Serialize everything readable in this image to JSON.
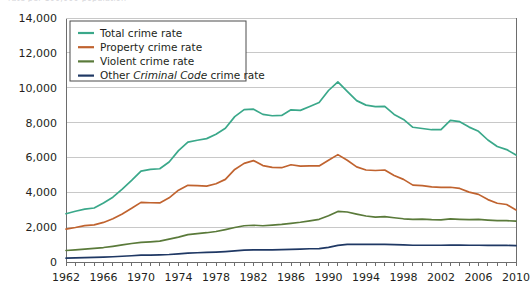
{
  "figure": {
    "clipped_top_text": "rate per 100,000 population",
    "background_color": "#ffffff"
  },
  "legend": {
    "position": "top-left-inside",
    "entries": [
      {
        "label": "Total crime rate",
        "color": "#3aa88a"
      },
      {
        "label": "Property crime rate",
        "color": "#c0632f"
      },
      {
        "label": "Violent crime rate",
        "color": "#5a7a3a"
      },
      {
        "label_prefix": "Other ",
        "label_emphasis": "Criminal Code",
        "label_suffix": " crime rate",
        "color": "#1f3864"
      }
    ]
  },
  "axes": {
    "y_tick_labels": [
      "14,000",
      "12,000",
      "10,000",
      "8,000",
      "6,000",
      "4,000",
      "2,000",
      "0"
    ],
    "x_tick_labels": [
      "1962",
      "1966",
      "1970",
      "1974",
      "1978",
      "1982",
      "1986",
      "1990",
      "1994",
      "1998",
      "2002",
      "2006",
      "2010"
    ],
    "grid_color": "#c8c8c8",
    "axis_color": "#6d6d6d"
  },
  "chart_data": {
    "type": "line",
    "title": "",
    "xlabel": "",
    "ylabel": "",
    "ylim": [
      0,
      14000
    ],
    "xlim": [
      1962,
      2010
    ],
    "grid": true,
    "legend_position": "top-left",
    "x": [
      1962,
      1963,
      1964,
      1965,
      1966,
      1967,
      1968,
      1969,
      1970,
      1971,
      1972,
      1973,
      1974,
      1975,
      1976,
      1977,
      1978,
      1979,
      1980,
      1981,
      1982,
      1983,
      1984,
      1985,
      1986,
      1987,
      1988,
      1989,
      1990,
      1991,
      1992,
      1993,
      1994,
      1995,
      1996,
      1997,
      1998,
      1999,
      2000,
      2001,
      2002,
      2003,
      2004,
      2005,
      2006,
      2007,
      2008,
      2009,
      2010
    ],
    "series": [
      {
        "name": "Total crime rate",
        "color": "#3aa88a",
        "values": [
          2771,
          2913,
          3030,
          3100,
          3390,
          3720,
          4180,
          4680,
          5210,
          5310,
          5350,
          5740,
          6390,
          6880,
          6985,
          7080,
          7330,
          7670,
          8340,
          8740,
          8770,
          8470,
          8390,
          8410,
          8730,
          8700,
          8920,
          9150,
          9840,
          10340,
          9790,
          9260,
          9000,
          8910,
          8930,
          8470,
          8180,
          7730,
          7660,
          7590,
          7590,
          8130,
          8050,
          7740,
          7500,
          7000,
          6630,
          6450,
          6140
        ]
      },
      {
        "name": "Property crime rate",
        "color": "#c0632f",
        "values": [
          1891,
          1980,
          2090,
          2130,
          2270,
          2480,
          2760,
          3080,
          3420,
          3400,
          3390,
          3680,
          4120,
          4400,
          4380,
          4350,
          4490,
          4740,
          5310,
          5660,
          5820,
          5530,
          5430,
          5410,
          5580,
          5500,
          5520,
          5510,
          5840,
          6160,
          5840,
          5460,
          5280,
          5250,
          5280,
          4960,
          4740,
          4410,
          4380,
          4310,
          4280,
          4290,
          4220,
          4010,
          3880,
          3580,
          3370,
          3300,
          2990
        ]
      },
      {
        "name": "Violent crime rate",
        "color": "#5a7a3a",
        "values": [
          660,
          700,
          740,
          780,
          830,
          900,
          980,
          1060,
          1130,
          1160,
          1200,
          1310,
          1430,
          1570,
          1630,
          1680,
          1750,
          1860,
          1980,
          2080,
          2110,
          2080,
          2120,
          2160,
          2220,
          2280,
          2360,
          2450,
          2650,
          2900,
          2870,
          2750,
          2640,
          2570,
          2600,
          2540,
          2480,
          2440,
          2460,
          2430,
          2420,
          2470,
          2450,
          2430,
          2440,
          2400,
          2370,
          2370,
          2340
        ]
      },
      {
        "name": "Other Criminal Code crime rate",
        "color": "#1f3864",
        "values": [
          220,
          233,
          250,
          260,
          275,
          300,
          330,
          360,
          390,
          400,
          410,
          430,
          470,
          510,
          530,
          550,
          570,
          600,
          640,
          680,
          700,
          700,
          700,
          710,
          730,
          740,
          760,
          770,
          840,
          950,
          1010,
          1010,
          1010,
          1010,
          1010,
          1000,
          980,
          960,
          960,
          960,
          960,
          970,
          970,
          960,
          960,
          950,
          950,
          950,
          940
        ]
      }
    ]
  }
}
